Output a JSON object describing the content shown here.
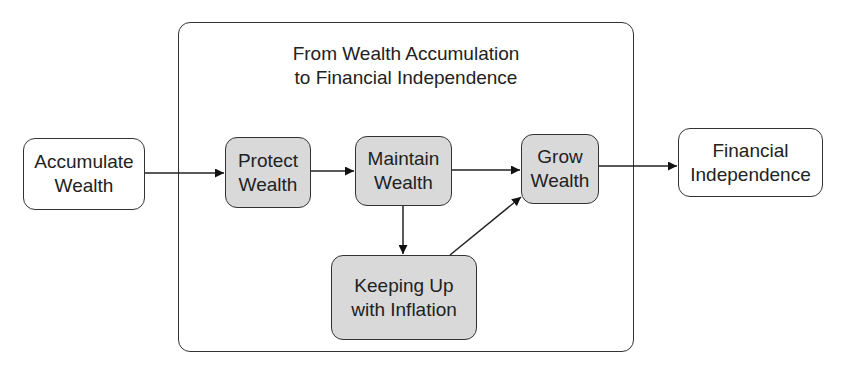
{
  "diagram": {
    "title_line1": "From Wealth Accumulation",
    "title_line2": "to Financial Independence",
    "nodes": [
      {
        "id": "accumulate",
        "line1": "Accumulate",
        "line2": "Wealth",
        "fill": "#ffffff"
      },
      {
        "id": "protect",
        "line1": "Protect",
        "line2": "Wealth",
        "fill": "#d9d9d9"
      },
      {
        "id": "maintain",
        "line1": "Maintain",
        "line2": "Wealth",
        "fill": "#d9d9d9"
      },
      {
        "id": "grow",
        "line1": "Grow",
        "line2": "Wealth",
        "fill": "#d9d9d9"
      },
      {
        "id": "independence",
        "line1": "Financial",
        "line2": "Independence",
        "fill": "#ffffff"
      },
      {
        "id": "inflation",
        "line1": "Keeping Up",
        "line2": "with Inflation",
        "fill": "#d9d9d9"
      }
    ],
    "edges": [
      {
        "from": "accumulate",
        "to": "protect"
      },
      {
        "from": "protect",
        "to": "maintain"
      },
      {
        "from": "maintain",
        "to": "grow"
      },
      {
        "from": "maintain",
        "to": "inflation"
      },
      {
        "from": "inflation",
        "to": "grow"
      },
      {
        "from": "grow",
        "to": "independence"
      }
    ]
  }
}
